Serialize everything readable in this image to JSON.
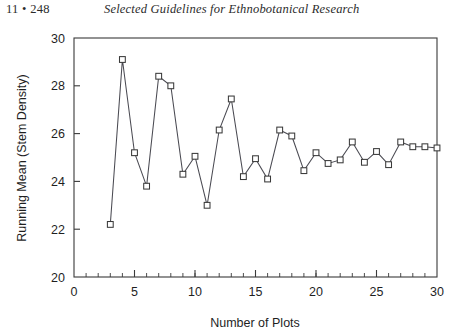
{
  "page": {
    "folio": "11 • 248",
    "running_title": "Selected Guidelines for Ethnobotanical Research"
  },
  "figure": {
    "frame_color": "#3a3a3a",
    "line_color": "#4a4a52",
    "marker_fill": "#ffffff",
    "background": "#ffffff"
  },
  "chart_data": {
    "type": "line",
    "title": "",
    "subtitle": "",
    "xlabel": "Number of Plots",
    "ylabel": "Running Mean (Stem Density)",
    "xlim": [
      0,
      30
    ],
    "ylim": [
      20,
      30
    ],
    "xticks": [
      0,
      5,
      10,
      15,
      20,
      25,
      30
    ],
    "xtick_labels": [
      "0",
      "5",
      "10",
      "15",
      "20",
      "25",
      "30"
    ],
    "x_minor_tick_step": 1,
    "yticks": [
      20,
      22,
      24,
      26,
      28,
      30
    ],
    "ytick_labels": [
      "20",
      "22",
      "24",
      "26",
      "28",
      "30"
    ],
    "grid": false,
    "legend": null,
    "marker": "open-square",
    "x": [
      3,
      4,
      5,
      6,
      7,
      8,
      9,
      10,
      11,
      12,
      13,
      14,
      15,
      16,
      17,
      18,
      19,
      20,
      21,
      22,
      23,
      24,
      25,
      26,
      27,
      28,
      29,
      30
    ],
    "y": [
      22.2,
      29.1,
      25.2,
      23.8,
      28.4,
      28.0,
      24.3,
      25.05,
      23.0,
      26.15,
      27.45,
      24.2,
      24.95,
      24.1,
      26.15,
      25.9,
      24.45,
      25.2,
      24.75,
      24.9,
      25.65,
      24.8,
      25.25,
      24.7,
      25.65,
      25.45,
      25.45,
      25.4
    ],
    "series": [
      {
        "name": "Running mean stem density",
        "values": [
          22.2,
          29.1,
          25.2,
          23.8,
          28.4,
          28.0,
          24.3,
          25.05,
          23.0,
          26.15,
          27.45,
          24.2,
          24.95,
          24.1,
          26.15,
          25.9,
          24.45,
          25.2,
          24.75,
          24.9,
          25.65,
          24.8,
          25.25,
          24.7,
          25.65,
          25.45,
          25.45,
          25.4
        ]
      }
    ]
  }
}
